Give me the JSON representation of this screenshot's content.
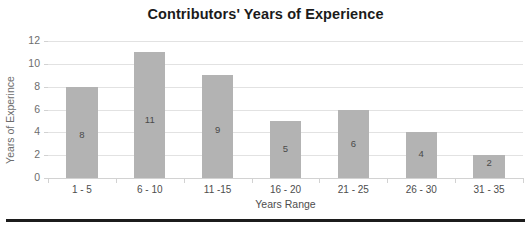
{
  "chart_data": {
    "type": "bar",
    "title": "Contributors' Years of Experience",
    "xlabel": "Years Range",
    "ylabel": "Years of Experince",
    "categories": [
      "1 - 5",
      "6 - 10",
      "11 -15",
      "16 - 20",
      "21 - 25",
      "26 - 30",
      "31 - 35"
    ],
    "values": [
      8,
      11,
      9,
      5,
      6,
      4,
      2
    ],
    "value_labels": [
      "8",
      "11",
      "9",
      "5",
      "6",
      "4",
      "2"
    ],
    "ylim": [
      0,
      12
    ],
    "yticks": [
      0,
      2,
      4,
      6,
      8,
      10,
      12
    ],
    "ytick_labels": [
      "0",
      "2",
      "4",
      "6",
      "8",
      "10",
      "12"
    ],
    "grid": true,
    "legend": false,
    "bar_color": "#b3b3b3",
    "gridline_color": "#e2e2e2",
    "title_color": "#1b1b1b",
    "axis_text_color": "#4d4d4d"
  }
}
